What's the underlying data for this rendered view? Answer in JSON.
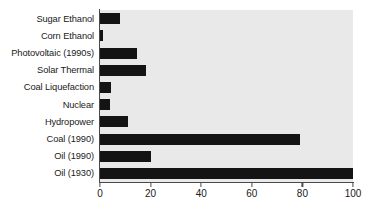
{
  "chart_data": {
    "type": "bar",
    "orientation": "horizontal",
    "title": "",
    "subtitle": "",
    "xlabel": "",
    "ylabel": "",
    "xlim": [
      0,
      100
    ],
    "xticks": [
      0,
      20,
      40,
      60,
      80,
      100
    ],
    "xtick_labels": [
      "0",
      "20",
      "40",
      "60",
      "80",
      "100"
    ],
    "grid": false,
    "legend": false,
    "legend_position": "none",
    "bar_color": "#141414",
    "plot_background": "#e9e9e9",
    "axis_color": "#4a4a4a",
    "categories": [
      "Sugar Ethanol",
      "Corn Ethanol",
      "Photovoltaic (1990s)",
      "Solar Thermal",
      "Coal Liquefaction",
      "Nuclear",
      "Hydropower",
      "Coal (1990)",
      "Oil (1990)",
      "Oil (1930)"
    ],
    "values": [
      8,
      1,
      14.5,
      18,
      4.5,
      4,
      11,
      79,
      20,
      100
    ],
    "annotations": []
  }
}
